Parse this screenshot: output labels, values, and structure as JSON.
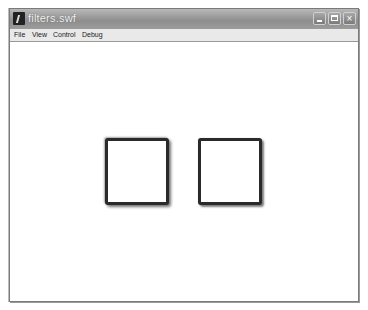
{
  "window": {
    "title": "filters.swf",
    "icon": "flash-player-icon",
    "controls": {
      "minimize": "minimize",
      "maximize": "maximize",
      "close": "×"
    }
  },
  "menubar": {
    "items": [
      {
        "label": "File"
      },
      {
        "label": "View"
      },
      {
        "label": "Control"
      },
      {
        "label": "Debug"
      }
    ]
  },
  "stage": {
    "background": "#ffffff",
    "shapes": [
      {
        "name": "left-square",
        "fill": "#ffffff",
        "stroke": "#2a2a2a",
        "effect": "drop shadow / bevel filter"
      },
      {
        "name": "right-square",
        "fill": "#ffffff",
        "stroke": "#2a2a2a",
        "effect": "drop shadow filter"
      }
    ]
  }
}
